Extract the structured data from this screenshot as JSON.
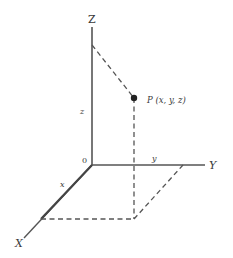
{
  "diagram": {
    "type": "3d-coordinate-system",
    "colors": {
      "axis": "#555555",
      "dashed": "#555555",
      "point": "#222222",
      "text": "#3a3a3a",
      "background": "#ffffff"
    },
    "axes": {
      "z_label": "Z",
      "y_label": "Y",
      "x_label": "X",
      "origin_label": "0"
    },
    "components": {
      "z_label": "z",
      "y_label": "y",
      "x_label": "x"
    },
    "point": {
      "label": "P (x, y, z)"
    }
  }
}
